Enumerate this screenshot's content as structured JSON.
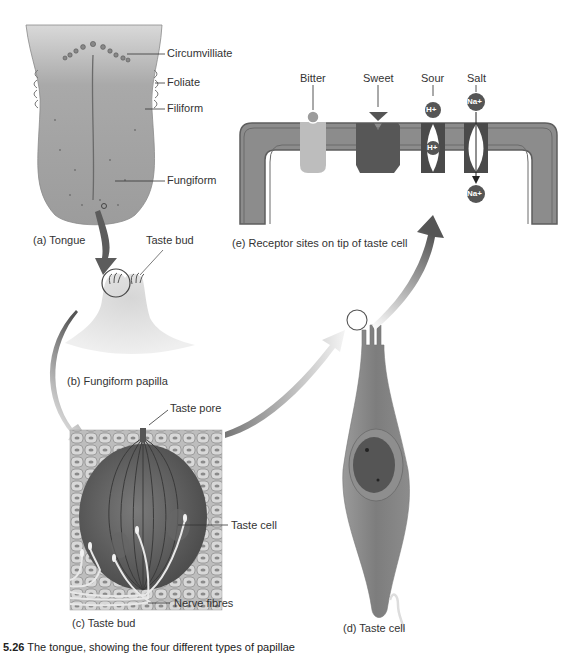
{
  "figure": {
    "caption_number": "5.26",
    "caption_text": "The tongue, showing the four different types of papillae",
    "panels": {
      "a": {
        "label": "(a) Tongue",
        "callouts": [
          "Circumvilliate",
          "Foliate",
          "Filiform",
          "Fungiform"
        ]
      },
      "b": {
        "label": "(b) Fungiform papilla",
        "callouts": [
          "Taste bud"
        ]
      },
      "c": {
        "label": "(c) Taste bud",
        "callouts": [
          "Taste pore",
          "Taste cell",
          "Nerve fibres"
        ]
      },
      "d": {
        "label": "(d) Taste cell"
      },
      "e": {
        "label": "(e) Receptor sites on tip of taste cell",
        "receptors": [
          "Bitter",
          "Sweet",
          "Sour",
          "Salt"
        ],
        "ions": {
          "sour_out": "H+",
          "sour_in": "H+",
          "salt_out": "Na+",
          "salt_in": "Na+"
        }
      }
    },
    "colors": {
      "membrane_dark": "#6e6e6e",
      "membrane_mid": "#8c8c8c",
      "bitter": "#bdbdbd",
      "sweet": "#5a5a5a",
      "ion": "#555555",
      "arrow": "#5f5f5f"
    }
  }
}
